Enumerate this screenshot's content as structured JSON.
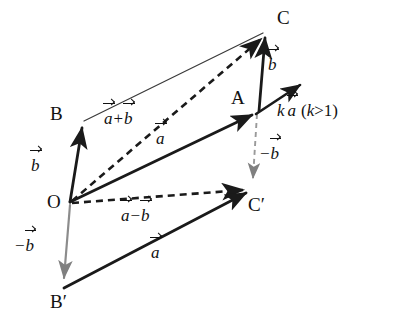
{
  "figure": {
    "background_color": "#ffffff",
    "stroke_color": "#1a1a1a",
    "gray_color": "#808080",
    "width": 395,
    "height": 332
  },
  "points": {
    "O": {
      "label": "O",
      "x": 70,
      "y": 203
    },
    "A": {
      "label": "A",
      "x": 258,
      "y": 112
    },
    "B": {
      "label": "B",
      "x": 82,
      "y": 122
    },
    "C": {
      "label": "C",
      "x": 266,
      "y": 31
    },
    "B_prime": {
      "label": "B",
      "prime": "′",
      "x": 63,
      "y": 288
    },
    "C_prime": {
      "label": "C",
      "prime": "′",
      "x": 252,
      "y": 190
    }
  },
  "point_labels": [
    {
      "name": "label-C",
      "text": "C",
      "x": 277,
      "y": 8,
      "prime": ""
    },
    {
      "name": "label-A",
      "text": "A",
      "x": 231,
      "y": 88,
      "prime": ""
    },
    {
      "name": "label-B",
      "text": "B",
      "x": 50,
      "y": 104,
      "prime": ""
    },
    {
      "name": "label-O",
      "text": "O",
      "x": 47,
      "y": 192,
      "prime": ""
    },
    {
      "name": "label-B-prime",
      "text": "B",
      "x": 50,
      "y": 292,
      "prime": "′"
    },
    {
      "name": "label-C-prime",
      "text": "C",
      "x": 248,
      "y": 195,
      "prime": "′"
    }
  ],
  "vector_labels": {
    "b_left": {
      "letter": "b",
      "x": 31,
      "y": 155
    },
    "b_right": {
      "letter": "b",
      "x": 268,
      "y": 54
    },
    "a_plus_b": {
      "first": "a",
      "op": "+",
      "second": "b",
      "x": 104,
      "y": 108
    },
    "a_upper": {
      "letter": "a",
      "x": 156,
      "y": 128
    },
    "a_minus_b": {
      "first": "a",
      "op": "−",
      "second": "b",
      "x": 121,
      "y": 205
    },
    "a_lower": {
      "letter": "a",
      "x": 151,
      "y": 242
    },
    "minus_b_left": {
      "op": "−",
      "letter": "b",
      "x": 14,
      "y": 235
    },
    "minus_b_right": {
      "op": "−",
      "letter": "b",
      "x": 259,
      "y": 143
    },
    "k_a_condition": {
      "k": "k",
      "letter": "a",
      "condition": "(k>1)",
      "open": "(",
      "k2": "k",
      "gt": ">",
      "one": "1",
      "close": ")",
      "x": 277,
      "y": 100
    }
  },
  "segments": [
    {
      "name": "vector-O-to-A",
      "from": "O",
      "to": "A",
      "style": "solid",
      "color": "#1a1a1a",
      "arrow": true,
      "width": 2.6,
      "label": "a"
    },
    {
      "name": "vector-O-to-B",
      "from": "O",
      "to": "B",
      "style": "solid",
      "color": "#1a1a1a",
      "arrow": true,
      "width": 2.6,
      "label": "b"
    },
    {
      "name": "vector-A-to-C",
      "from": "A",
      "to": "C",
      "style": "solid",
      "color": "#1a1a1a",
      "arrow": true,
      "width": 2.6,
      "label": "b"
    },
    {
      "name": "line-B-to-C",
      "from": "B",
      "to": "C",
      "style": "solid",
      "color": "#333333",
      "arrow": false,
      "width": 1.1,
      "label": ""
    },
    {
      "name": "vector-O-to-C",
      "from": "O",
      "to": "C",
      "style": "dashed",
      "color": "#1a1a1a",
      "arrow": true,
      "width": 2.4,
      "label": "a+b"
    },
    {
      "name": "vector-O-to-Cprime",
      "from": "O",
      "to": "C_prime",
      "style": "dashed",
      "color": "#1a1a1a",
      "arrow": true,
      "width": 2.4,
      "label": "a-b"
    },
    {
      "name": "vector-A-to-Cprime",
      "from": "A",
      "to": "C_prime",
      "style": "dashed",
      "color": "#808080",
      "arrow": true,
      "width": 1.8,
      "label": "-b"
    },
    {
      "name": "vector-O-to-Bprime",
      "from": "O",
      "to": "B_prime",
      "style": "solid",
      "color": "#808080",
      "arrow": true,
      "width": 2.0,
      "label": "-b"
    },
    {
      "name": "vector-Bprime-to-Cprime",
      "from": "B_prime",
      "to": "C_prime",
      "style": "solid",
      "color": "#1a1a1a",
      "arrow": true,
      "width": 2.6,
      "label": "a"
    },
    {
      "name": "ray-k-a",
      "from": "A",
      "to": "K",
      "style": "solid",
      "color": "#1a1a1a",
      "arrow": true,
      "width": 2.4,
      "label": "ka"
    }
  ]
}
